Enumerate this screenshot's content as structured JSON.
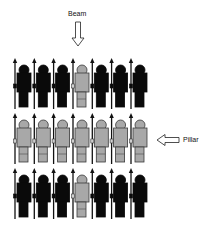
{
  "labels": {
    "beam": "Beam",
    "pillar": "Pillar"
  },
  "colors": {
    "dark": "#0a0a0a",
    "light_fill": "#a8a8a8",
    "light_stroke": "#3a3a3a",
    "spear": "#111111"
  },
  "formation": {
    "columns": 7,
    "rows": 3,
    "grid": [
      [
        "dark",
        "dark",
        "dark",
        "light",
        "dark",
        "dark",
        "dark"
      ],
      [
        "light",
        "light",
        "light",
        "light",
        "light",
        "light",
        "light"
      ],
      [
        "dark",
        "dark",
        "dark",
        "light",
        "dark",
        "dark",
        "dark"
      ]
    ]
  },
  "annotations": [
    {
      "label": "Beam",
      "arrow": "down",
      "target": "column 4"
    },
    {
      "label": "Pillar",
      "arrow": "left",
      "target": "row 2"
    }
  ]
}
